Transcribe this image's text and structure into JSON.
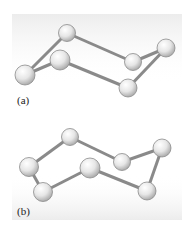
{
  "panels": [
    {
      "label": "(a)",
      "label_pos": [
        17,
        94
      ],
      "balls": [
        {
          "id": "a1",
          "cx": 25,
          "cy": 75,
          "r": 10
        },
        {
          "id": "a2",
          "cx": 67,
          "cy": 33,
          "r": 8.5
        },
        {
          "id": "a3",
          "cx": 60,
          "cy": 60,
          "r": 10
        },
        {
          "id": "a4",
          "cx": 133,
          "cy": 62,
          "r": 8.5
        },
        {
          "id": "a5",
          "cx": 166,
          "cy": 48,
          "r": 9
        },
        {
          "id": "a6",
          "cx": 128,
          "cy": 88,
          "r": 9
        }
      ],
      "bonds": [
        [
          "a1",
          "a2"
        ],
        [
          "a1",
          "a3"
        ],
        [
          "a2",
          "a4"
        ],
        [
          "a4",
          "a5"
        ],
        [
          "a3",
          "a6"
        ],
        [
          "a6",
          "a5"
        ]
      ]
    },
    {
      "label": "(b)",
      "label_pos": [
        17,
        205
      ],
      "balls": [
        {
          "id": "b1",
          "cx": 70,
          "cy": 137,
          "r": 8.5
        },
        {
          "id": "b2",
          "cx": 29,
          "cy": 167,
          "r": 9.5
        },
        {
          "id": "b3",
          "cx": 43,
          "cy": 192,
          "r": 9.5
        },
        {
          "id": "b4",
          "cx": 90,
          "cy": 168,
          "r": 10
        },
        {
          "id": "b5",
          "cx": 122,
          "cy": 162,
          "r": 8.5
        },
        {
          "id": "b6",
          "cx": 162,
          "cy": 148,
          "r": 9
        },
        {
          "id": "b7",
          "cx": 147,
          "cy": 191,
          "r": 9
        }
      ],
      "bonds": [
        [
          "b2",
          "b1"
        ],
        [
          "b1",
          "b5"
        ],
        [
          "b5",
          "b6"
        ],
        [
          "b6",
          "b7"
        ],
        [
          "b7",
          "b4"
        ],
        [
          "b4",
          "b3"
        ],
        [
          "b3",
          "b2"
        ]
      ]
    }
  ],
  "colors": {
    "bond": "#8a8a8a",
    "ball_light": "#ffffff",
    "ball_dark": "#b8b8b8",
    "ball_stroke": "#8c8c8c",
    "bg_grad": "#efefef"
  }
}
